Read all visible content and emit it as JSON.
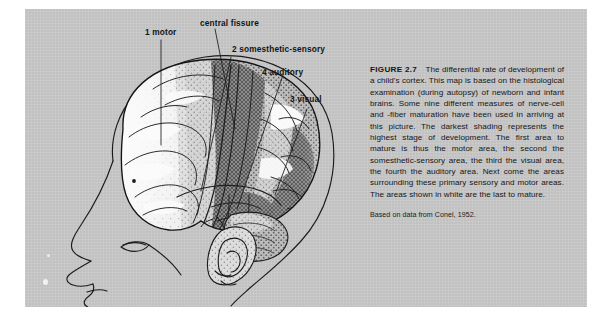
{
  "figure": {
    "id": "figure-2-7",
    "plate_background_color": "#c9c9c9",
    "page_background_color": "#ffffff",
    "ink_color": "#161616"
  },
  "illustration": {
    "name": "lateral-view-of-child-head-and-brain-cortex-maturation-map",
    "description": "Side profile drawing of an infant head with the skull outline and the cerebral cortex shown in stippled shading; darkest shading marks the most mature cortical areas.",
    "shading_legend": [
      {
        "level": "darkest",
        "meaning": "highest stage of development"
      },
      {
        "level": "medium",
        "meaning": "intermediate maturation, areas surrounding the primary sensory and motor areas"
      },
      {
        "level": "white",
        "meaning": "last to mature"
      }
    ],
    "regions": [
      {
        "number": "1",
        "name": "motor"
      },
      {
        "number": "2",
        "name": "somesthetic-sensory"
      },
      {
        "number": "3",
        "name": "visual"
      },
      {
        "number": "4",
        "name": "auditory"
      }
    ]
  },
  "callouts": {
    "motor": "1 motor",
    "central_fissure": "central fissure",
    "somesthetic_sensory": "2 somesthetic-sensory",
    "auditory": "4 auditory",
    "visual": "3 visual"
  },
  "caption": {
    "figure_number": "FIGURE 2.7",
    "text": "The differential rate of development of a child's cortex. This map is based on the histological examination (during autopsy) of newborn and infant brains. Some nine different measures of nerve-cell and -fiber maturation have been used in arriving at this picture. The darkest shading represents the highest stage of development. The first area to mature is thus the motor area, the second the somesthetic-sensory area, the third the visual area, the fourth the auditory area. Next come the areas surrounding these primary sensory and motor areas. The areas shown in white are the last to mature.",
    "source": "Based on data from Conel, 1952."
  }
}
